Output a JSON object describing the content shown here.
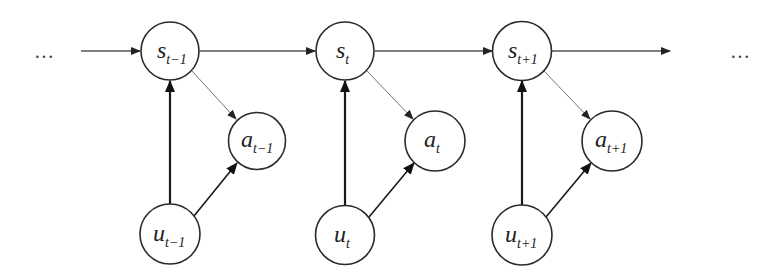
{
  "diagram": {
    "type": "dynamic-bayesian-network",
    "ellipsis_left": "…",
    "ellipsis_right": "…",
    "colors": {
      "background": "#ffffff",
      "node_stroke": "#2a2a2a",
      "chain_edge": "#555555",
      "state_to_action_edge": "#777777",
      "input_edge": "#1a1a1a"
    },
    "slices": [
      {
        "index": "t-1",
        "s": {
          "base": "s",
          "sub": "t−1",
          "cx": 170,
          "cy": 51
        },
        "a": {
          "base": "a",
          "sub": "t−1",
          "cx": 257,
          "cy": 141
        },
        "u": {
          "base": "u",
          "sub": "t−1",
          "cx": 170,
          "cy": 234
        }
      },
      {
        "index": "t",
        "s": {
          "base": "s",
          "sub": "t",
          "cx": 345,
          "cy": 51
        },
        "a": {
          "base": "a",
          "sub": "t",
          "cx": 435,
          "cy": 141
        },
        "u": {
          "base": "u",
          "sub": "t",
          "cx": 345,
          "cy": 235
        }
      },
      {
        "index": "t+1",
        "s": {
          "base": "s",
          "sub": "t+1",
          "cx": 522,
          "cy": 51
        },
        "a": {
          "base": "a",
          "sub": "t+1",
          "cx": 612,
          "cy": 141
        },
        "u": {
          "base": "u",
          "sub": "t+1",
          "cx": 522,
          "cy": 235
        }
      }
    ],
    "edges": [
      {
        "from": "...",
        "to": "s_{t-1}",
        "kind": "chain"
      },
      {
        "from": "s_{t-1}",
        "to": "s_t",
        "kind": "chain"
      },
      {
        "from": "s_t",
        "to": "s_{t+1}",
        "kind": "chain"
      },
      {
        "from": "s_{t+1}",
        "to": "...",
        "kind": "chain"
      },
      {
        "from": "s_{t-1}",
        "to": "a_{t-1}",
        "kind": "state-action"
      },
      {
        "from": "s_t",
        "to": "a_t",
        "kind": "state-action"
      },
      {
        "from": "s_{t+1}",
        "to": "a_{t+1}",
        "kind": "state-action"
      },
      {
        "from": "u_{t-1}",
        "to": "s_{t-1}",
        "kind": "input-state"
      },
      {
        "from": "u_t",
        "to": "s_t",
        "kind": "input-state"
      },
      {
        "from": "u_{t+1}",
        "to": "s_{t+1}",
        "kind": "input-state"
      },
      {
        "from": "u_{t-1}",
        "to": "a_{t-1}",
        "kind": "input-action"
      },
      {
        "from": "u_t",
        "to": "a_t",
        "kind": "input-action"
      },
      {
        "from": "u_{t+1}",
        "to": "a_{t+1}",
        "kind": "input-action"
      }
    ]
  }
}
